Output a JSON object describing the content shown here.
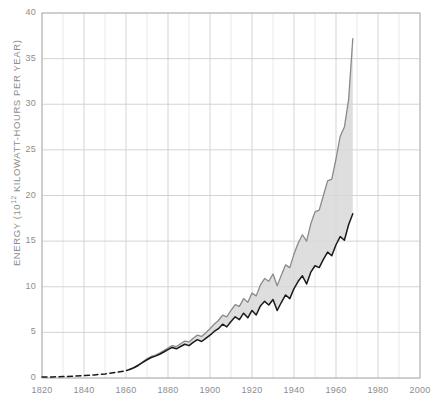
{
  "chart_data": {
    "type": "area",
    "title": "",
    "subtitle": "",
    "xlabel": "",
    "ylabel": "ENERGY (10¹² KILOWATT-HOURS PER YEAR)",
    "ylabel_base": "ENERGY (10",
    "ylabel_exponent": "12",
    "ylabel_tail": " KILOWATT-HOURS PER YEAR)",
    "xlim": [
      1820,
      2000
    ],
    "ylim": [
      0,
      40
    ],
    "xticks": [
      1820,
      1840,
      1860,
      1880,
      1900,
      1920,
      1940,
      1960,
      1980,
      2000
    ],
    "yticks": [
      0,
      5,
      10,
      15,
      20,
      25,
      30,
      35,
      40
    ],
    "xtick_labels": [
      "1820",
      "1840",
      "1860",
      "1880",
      "1900",
      "1920",
      "1940",
      "1960",
      "1980",
      "2000"
    ],
    "ytick_labels": [
      "0",
      "5",
      "10",
      "15",
      "20",
      "25",
      "30",
      "35",
      "40"
    ],
    "grid": true,
    "grid_x_step": 20,
    "grid_y_step": 5,
    "legend": "none",
    "fill_between": true,
    "fill_color": "#d8d8d8",
    "lower_series_color": "#1a1a1a",
    "upper_series_color": "#8a8a8a",
    "grid_color": "#cfcfcf",
    "axis_color": "#b4b4b4",
    "tick_text_color": "#8d8d8d",
    "dashed_from": 1820,
    "dashed_to": 1862,
    "series": [
      {
        "name": "lower-bound-energy",
        "style": "solid-dark",
        "x": [
          1820,
          1825,
          1830,
          1835,
          1840,
          1845,
          1850,
          1855,
          1860,
          1862,
          1864,
          1866,
          1868,
          1870,
          1872,
          1874,
          1876,
          1878,
          1880,
          1882,
          1884,
          1886,
          1888,
          1890,
          1892,
          1894,
          1896,
          1898,
          1900,
          1902,
          1904,
          1906,
          1908,
          1910,
          1912,
          1914,
          1916,
          1918,
          1920,
          1922,
          1924,
          1926,
          1928,
          1930,
          1932,
          1934,
          1936,
          1938,
          1940,
          1942,
          1944,
          1946,
          1948,
          1950,
          1952,
          1954,
          1956,
          1958,
          1960,
          1962,
          1964,
          1966,
          1968
        ],
        "y": [
          0.1,
          0.12,
          0.16,
          0.2,
          0.26,
          0.34,
          0.45,
          0.6,
          0.8,
          0.95,
          1.15,
          1.4,
          1.7,
          2.0,
          2.25,
          2.4,
          2.6,
          2.85,
          3.1,
          3.35,
          3.2,
          3.45,
          3.7,
          3.55,
          3.9,
          4.2,
          4.0,
          4.35,
          4.7,
          5.1,
          5.4,
          5.9,
          5.6,
          6.2,
          6.7,
          6.4,
          7.1,
          6.6,
          7.4,
          6.9,
          7.9,
          8.4,
          8.0,
          8.6,
          7.4,
          8.3,
          9.1,
          8.7,
          9.8,
          10.6,
          11.2,
          10.3,
          11.6,
          12.3,
          12.1,
          13.0,
          13.8,
          13.4,
          14.6,
          15.5,
          15.1,
          16.8,
          18.0
        ]
      },
      {
        "name": "upper-bound-energy",
        "style": "solid-gray",
        "x": [
          1820,
          1825,
          1830,
          1835,
          1840,
          1845,
          1850,
          1855,
          1860,
          1862,
          1864,
          1866,
          1868,
          1870,
          1872,
          1874,
          1876,
          1878,
          1880,
          1882,
          1884,
          1886,
          1888,
          1890,
          1892,
          1894,
          1896,
          1898,
          1900,
          1902,
          1904,
          1906,
          1908,
          1910,
          1912,
          1914,
          1916,
          1918,
          1920,
          1922,
          1924,
          1926,
          1928,
          1930,
          1932,
          1934,
          1936,
          1938,
          1940,
          1942,
          1944,
          1946,
          1948,
          1950,
          1952,
          1954,
          1956,
          1958,
          1960,
          1962,
          1964,
          1966,
          1968
        ],
        "y": [
          0.1,
          0.12,
          0.16,
          0.2,
          0.26,
          0.34,
          0.45,
          0.6,
          0.82,
          0.98,
          1.2,
          1.46,
          1.78,
          2.1,
          2.36,
          2.52,
          2.74,
          3.0,
          3.28,
          3.56,
          3.45,
          3.75,
          4.05,
          3.95,
          4.35,
          4.7,
          4.55,
          4.95,
          5.4,
          5.9,
          6.3,
          6.9,
          6.7,
          7.4,
          8.05,
          7.85,
          8.7,
          8.3,
          9.3,
          9.0,
          10.2,
          10.9,
          10.6,
          11.4,
          10.1,
          11.3,
          12.4,
          12.1,
          13.6,
          14.8,
          15.7,
          15.0,
          16.9,
          18.2,
          18.4,
          20.0,
          21.6,
          21.8,
          24.0,
          26.5,
          27.5,
          30.5,
          37.2
        ]
      }
    ],
    "notes": {
      "dashed_segment": "1820-1862 rendered as dashed extrapolation",
      "band_description": "shaded gray region between lower dark curve and upper gray curve"
    }
  },
  "axes": {
    "y_axis_name": "energy-axis",
    "x_axis_name": "year-axis"
  }
}
